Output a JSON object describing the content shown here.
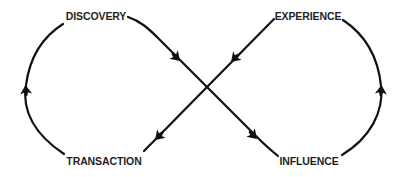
{
  "diagram": {
    "type": "infinity-loop-cycle",
    "stroke_color": "#111111",
    "text_color": "#1f1f1f",
    "background": "#ffffff",
    "nodes": [
      {
        "id": "discovery",
        "label": "DISCOVERY"
      },
      {
        "id": "experience",
        "label": "EXPERIENCE"
      },
      {
        "id": "influence",
        "label": "INFLUENCE"
      },
      {
        "id": "transaction",
        "label": "TRANSACTION"
      }
    ],
    "edges": [
      {
        "from": "discovery",
        "to": "influence",
        "shape": "diagonal"
      },
      {
        "from": "influence",
        "to": "experience",
        "shape": "right-arc"
      },
      {
        "from": "experience",
        "to": "transaction",
        "shape": "diagonal"
      },
      {
        "from": "transaction",
        "to": "discovery",
        "shape": "left-arc"
      }
    ]
  }
}
